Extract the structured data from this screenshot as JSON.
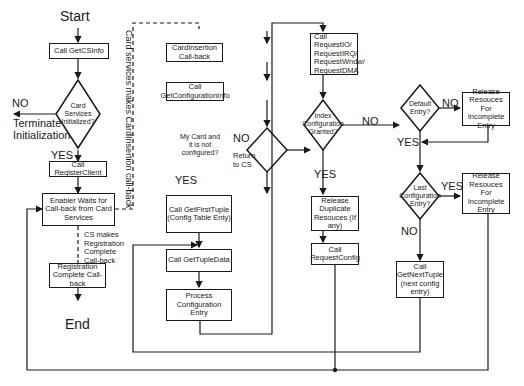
{
  "terminals": {
    "start": "Start",
    "end": "End"
  },
  "left_column": {
    "get_cs_info": "Call GetCSInfo",
    "cs_initialized": "Card Services Initialized?",
    "no_label": "NO",
    "terminate": "Terminate Initialization",
    "yes_label": "YES",
    "register_client": "Call RegisterClient",
    "enabler_waits": "Enabler Waits for Call-back from Card Services",
    "cs_makes_registration": "CS makes Registration Complete Call-back",
    "registration_complete": "Registration Complete Call-back"
  },
  "dashed_label": "Card services makes CardInsertion call-back",
  "middle_column": {
    "card_insertion": "CardInsertion Call-back",
    "get_config_info": "Call GetConfigurationInfo",
    "my_card": "My Card and it is not configured?",
    "no_label": "NO",
    "return_to_cs": "Return to CS",
    "yes_label": "YES",
    "get_first_tuple": "Call GetFirstTuple (Config Table Enty)",
    "get_tuple_data": "Call GetTupleData",
    "process_config": "Process Configuration Entry"
  },
  "right_column": {
    "request_resources": "Call RequestIO/ RequestIRQ/ RequestWndw/ RequestDMA",
    "index_granted": "Index Configuration Granted?",
    "no_label": "NO",
    "yes_label": "YES",
    "release_duplicate": "Release Duplicate Resouces (If any)",
    "request_config": "Call RequestConfig",
    "default_entry": "Default Entry?",
    "default_no": "NO",
    "default_yes": "YES",
    "release_incomplete_1": "Release Resouces For Incomplete Entry",
    "last_entry": "Last Configuration Entry?",
    "last_yes": "YES",
    "last_no": "NO",
    "release_incomplete_2": "Release Resouces For Incomplete Entry",
    "get_next_tuple": "Call GetNextTuple (next config entry)"
  }
}
